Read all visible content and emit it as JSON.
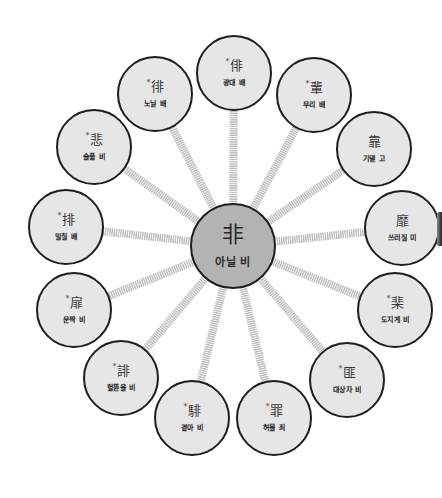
{
  "diagram": {
    "type": "radial-character-family",
    "center": {
      "hanja": "非",
      "gloss": "아닐 비",
      "x": 233,
      "y": 246,
      "r": 43
    },
    "nodes": [
      {
        "hanja": "俳",
        "asterisk": true,
        "gloss": "광대 배",
        "x": 234,
        "y": 73,
        "r": 38
      },
      {
        "hanja": "輩",
        "asterisk": true,
        "gloss": "무리 배",
        "x": 314,
        "y": 95,
        "r": 38
      },
      {
        "hanja": "靠",
        "asterisk": false,
        "gloss": "기댈 고",
        "x": 374,
        "y": 149,
        "r": 38
      },
      {
        "hanja": "靡",
        "asterisk": false,
        "gloss": "쓰러질 미",
        "x": 402,
        "y": 228,
        "r": 38
      },
      {
        "hanja": "棐",
        "asterisk": true,
        "gloss": "도지게 비",
        "x": 395,
        "y": 310,
        "r": 38
      },
      {
        "hanja": "匪",
        "asterisk": true,
        "gloss": "대상자 비",
        "x": 347,
        "y": 380,
        "r": 38
      },
      {
        "hanja": "罪",
        "asterisk": true,
        "gloss": "허물 죄",
        "x": 274,
        "y": 418,
        "r": 38
      },
      {
        "hanja": "騑",
        "asterisk": true,
        "gloss": "곁마 비",
        "x": 192,
        "y": 418,
        "r": 38
      },
      {
        "hanja": "誹",
        "asterisk": true,
        "gloss": "헐뜯을 비",
        "x": 121,
        "y": 378,
        "r": 38
      },
      {
        "hanja": "扉",
        "asterisk": true,
        "gloss": "문짝 비",
        "x": 74,
        "y": 310,
        "r": 38
      },
      {
        "hanja": "排",
        "asterisk": true,
        "gloss": "밀칠 배",
        "x": 66,
        "y": 227,
        "r": 38
      },
      {
        "hanja": "悲",
        "asterisk": true,
        "gloss": "슬플 비",
        "x": 94,
        "y": 147,
        "r": 38
      },
      {
        "hanja": "徘",
        "asterisk": true,
        "gloss": "노닐 배",
        "x": 155,
        "y": 94,
        "r": 38
      }
    ],
    "asterisk_symbol": "*",
    "colors": {
      "node_fill": "#e6e6e6",
      "center_fill": "#b3b3b3",
      "border": "#1e1e1e",
      "connector": "#bdbdbd",
      "connector_gap": "#ffffff"
    }
  }
}
